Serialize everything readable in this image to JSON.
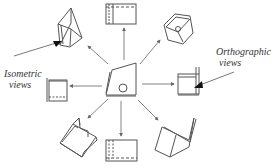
{
  "diagram": {
    "colors": {
      "stroke": "#555555",
      "arrow": "#666666",
      "pointer": "#111111",
      "text": "#333333"
    },
    "labels": {
      "isometric": {
        "line1": "Isometric",
        "line2": "views"
      },
      "orthographic": {
        "line1": "Orthographic",
        "line2": "views"
      }
    },
    "center_object": {
      "name": "object-isometric-center"
    },
    "views": [
      {
        "id": "top",
        "type": "orthographic"
      },
      {
        "id": "top-right",
        "type": "isometric"
      },
      {
        "id": "right",
        "type": "orthographic"
      },
      {
        "id": "bottom-right",
        "type": "isometric"
      },
      {
        "id": "bottom",
        "type": "orthographic"
      },
      {
        "id": "bottom-left",
        "type": "isometric"
      },
      {
        "id": "left",
        "type": "orthographic"
      },
      {
        "id": "top-left",
        "type": "isometric"
      }
    ]
  }
}
